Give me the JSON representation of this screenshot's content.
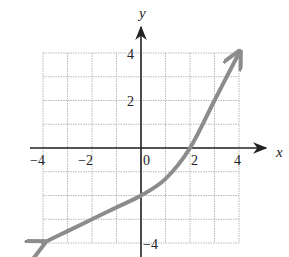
{
  "chart_data": {
    "type": "line",
    "title": "",
    "xlabel": "x",
    "ylabel": "y",
    "xlim": [
      -4,
      4
    ],
    "ylim": [
      -4,
      4
    ],
    "grid": true,
    "grid_step": 1,
    "x_tick_labels": [
      "-4",
      "-2",
      "0",
      "2",
      "4"
    ],
    "x_ticks": [
      -4,
      -2,
      0,
      2,
      4
    ],
    "y_tick_labels": [
      "4",
      "2",
      "-4"
    ],
    "y_ticks": [
      4,
      2,
      -4
    ],
    "series": [
      {
        "name": "f(x)",
        "x": [
          -4,
          -3,
          -2,
          -1,
          0,
          1,
          2,
          3,
          4
        ],
        "y": [
          -4,
          -3.5,
          -3,
          -2.5,
          -2,
          -1.3,
          0,
          2,
          4
        ],
        "arrows_at_ends": true,
        "color": "#8c8c8c"
      }
    ],
    "legend": null
  },
  "labels": {
    "x_axis": "x",
    "y_axis": "y",
    "x_ticks": [
      "−4",
      "−2",
      "0",
      "2",
      "4"
    ],
    "y_ticks": [
      "4",
      "2",
      "−4"
    ]
  },
  "colors": {
    "axis": "#222222",
    "grid": "#b8b8b8",
    "curve": "#8c8c8c"
  }
}
